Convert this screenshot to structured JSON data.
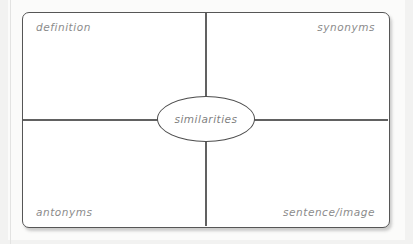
{
  "diagram": {
    "type": "four-square-vocabulary-graphic-organizer",
    "center": {
      "label": "similarities",
      "shape": "ellipse"
    },
    "quadrants": [
      {
        "position": "top-left",
        "label": "definition"
      },
      {
        "position": "top-right",
        "label": "synonyms"
      },
      {
        "position": "bottom-left",
        "label": "antonyms"
      },
      {
        "position": "bottom-right",
        "label": "sentence/image"
      }
    ],
    "colors": {
      "page_background": "#f2f2f1",
      "sheet": "#fbfbfa",
      "frame_border": "#565656",
      "divider": "#616161",
      "ellipse_border": "#4d4d4d",
      "text": "#8b8b8b",
      "fill": "#ffffff"
    }
  }
}
